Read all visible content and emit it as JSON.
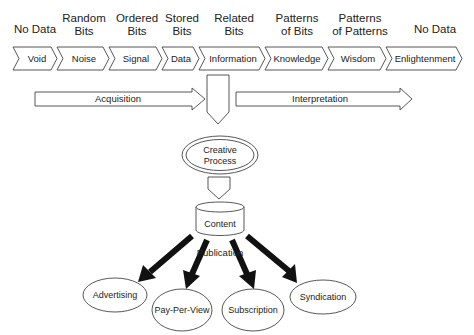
{
  "diagram": {
    "stages": [
      {
        "header_line1": "",
        "header_line2": "No Data",
        "label": "Void"
      },
      {
        "header_line1": "Random",
        "header_line2": "Bits",
        "label": "Noise"
      },
      {
        "header_line1": "Ordered",
        "header_line2": "Bits",
        "label": "Signal"
      },
      {
        "header_line1": "Stored",
        "header_line2": "Bits",
        "label": "Data"
      },
      {
        "header_line1": "Related",
        "header_line2": "Bits",
        "label": "Information"
      },
      {
        "header_line1": "Patterns",
        "header_line2": "of Bits",
        "label": "Knowledge"
      },
      {
        "header_line1": "Patterns",
        "header_line2": "of Patterns",
        "label": "Wisdom"
      },
      {
        "header_line1": "",
        "header_line2": "No Data",
        "label": "Enlightenment"
      }
    ],
    "arrows": {
      "acquisition": "Acquisition",
      "interpretation": "Interpretation"
    },
    "creative_process": {
      "line1": "Creative",
      "line2": "Process"
    },
    "content": "Content",
    "publication": "Publication",
    "outputs": [
      {
        "label": "Advertising"
      },
      {
        "label": "Pay-Per-View"
      },
      {
        "label": "Subscription"
      },
      {
        "label": "Syndication"
      }
    ]
  }
}
